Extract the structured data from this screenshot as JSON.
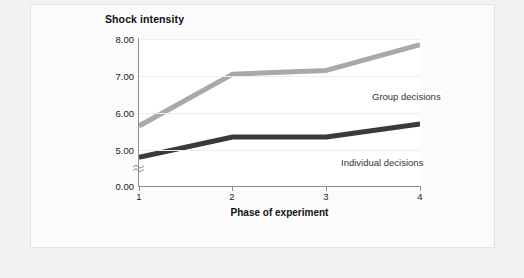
{
  "chart_data": {
    "type": "line",
    "title": "Shock intensity",
    "xlabel": "Phase of experiment",
    "ylabel": "",
    "x": [
      1,
      2,
      3,
      4
    ],
    "xticklabels": [
      "1",
      "2",
      "3",
      "4"
    ],
    "yticklabels": [
      "0.00",
      "5.00",
      "6.00",
      "7.00",
      "8.00"
    ],
    "ytickvalues": [
      0.0,
      5.0,
      6.0,
      7.0,
      8.0
    ],
    "ylim": [
      4.8,
      8.05
    ],
    "axis_break": true,
    "grid": true,
    "legend": "inline-labels",
    "series": [
      {
        "name": "Group decisions",
        "color": "#a9a9a9",
        "values": [
          5.65,
          7.05,
          7.15,
          7.85
        ]
      },
      {
        "name": "Individual decisions",
        "color": "#3a3a3a",
        "values": [
          4.8,
          5.35,
          5.35,
          5.7
        ]
      }
    ]
  },
  "labels": {
    "series_group": "Group decisions",
    "series_individual": "Individual decisions"
  },
  "colors": {
    "group_line": "#a9a9a9",
    "individual_line": "#3a3a3a",
    "grid": "#ededed",
    "axis": "#8d8d8d",
    "panel_bg": "#fbfbfb",
    "page_bg": "#f2f2f2"
  }
}
